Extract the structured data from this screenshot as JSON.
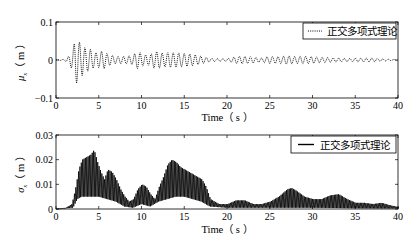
{
  "chart_data": [
    {
      "type": "line",
      "title": "",
      "xlabel": "Time（s）",
      "ylabel": "μx（m）",
      "xlim": [
        0,
        40
      ],
      "ylim": [
        -0.1,
        0.1
      ],
      "xticks": [
        "0",
        "5",
        "10",
        "15",
        "20",
        "25",
        "30",
        "35",
        "40"
      ],
      "yticks": [
        "-0.1",
        "0",
        "0.1"
      ],
      "grid": false,
      "legend": {
        "position": "upper right",
        "entries": [
          {
            "label": "正交多项式理论",
            "style": "dotted"
          }
        ]
      },
      "series": [
        {
          "name": "正交多项式理论",
          "style": "dotted",
          "envelope_t": [
            0,
            1,
            1.5,
            2,
            2.3,
            2.6,
            3,
            3.5,
            4,
            4.5,
            5,
            5.5,
            6,
            6.5,
            7,
            8,
            9,
            9.5,
            10,
            10.5,
            11,
            11.5,
            12,
            12.5,
            13,
            13.5,
            14,
            15,
            16,
            17,
            18,
            19,
            20,
            21,
            22,
            23,
            24,
            25,
            26,
            27,
            28,
            29,
            30,
            31,
            32,
            33,
            34,
            35,
            36,
            37,
            38,
            39,
            40
          ],
          "envelope_amp": [
            0.001,
            0.002,
            0.01,
            0.03,
            0.07,
            0.055,
            0.05,
            0.04,
            0.045,
            0.035,
            0.04,
            0.05,
            0.03,
            0.02,
            0.012,
            0.01,
            0.012,
            0.025,
            0.02,
            0.018,
            0.022,
            0.04,
            0.045,
            0.035,
            0.035,
            0.03,
            0.025,
            0.018,
            0.015,
            0.012,
            0.008,
            0.007,
            0.006,
            0.012,
            0.01,
            0.008,
            0.006,
            0.015,
            0.018,
            0.02,
            0.012,
            0.01,
            0.009,
            0.008,
            0.01,
            0.01,
            0.007,
            0.006,
            0.005,
            0.005,
            0.004,
            0.003,
            0.003
          ]
        }
      ]
    },
    {
      "type": "line",
      "title": "",
      "xlabel": "Time（s）",
      "ylabel": "σx（m）",
      "xlim": [
        0,
        40
      ],
      "ylim": [
        0,
        0.03
      ],
      "xticks": [
        "0",
        "5",
        "10",
        "15",
        "20",
        "25",
        "30",
        "35",
        "40"
      ],
      "yticks": [
        "0",
        "0.01",
        "0.02",
        "0.03"
      ],
      "grid": false,
      "legend": {
        "position": "upper right",
        "entries": [
          {
            "label": "正交多项式理论",
            "style": "solid"
          }
        ]
      },
      "series": [
        {
          "name": "正交多项式理论",
          "style": "solid",
          "upper_t": [
            0,
            1,
            1.8,
            2.2,
            2.6,
            3,
            3.5,
            4,
            4.4,
            4.8,
            5.2,
            5.6,
            6,
            6.5,
            7,
            7.5,
            8,
            8.5,
            9,
            9.5,
            10,
            10.5,
            11,
            11.5,
            12,
            12.5,
            13,
            13.5,
            14,
            14.5,
            15,
            16,
            17,
            17.5,
            18,
            19,
            20,
            21,
            22,
            23,
            24,
            25,
            26,
            26.5,
            27,
            27.5,
            28,
            29,
            30,
            31,
            32,
            33,
            34,
            35,
            36,
            37,
            38,
            39,
            40
          ],
          "upper_v": [
            0,
            0.0003,
            0.002,
            0.008,
            0.016,
            0.02,
            0.021,
            0.022,
            0.024,
            0.019,
            0.015,
            0.012,
            0.016,
            0.015,
            0.012,
            0.008,
            0.005,
            0.003,
            0.004,
            0.008,
            0.01,
            0.009,
            0.006,
            0.004,
            0.009,
            0.013,
            0.018,
            0.02,
            0.019,
            0.017,
            0.016,
            0.014,
            0.012,
            0.009,
            0.004,
            0.002,
            0.002,
            0.0035,
            0.0035,
            0.002,
            0.002,
            0.003,
            0.005,
            0.0065,
            0.008,
            0.0085,
            0.0075,
            0.005,
            0.004,
            0.004,
            0.0055,
            0.006,
            0.004,
            0.0025,
            0.0025,
            0.002,
            0.0025,
            0.0015,
            0.0008
          ],
          "lower_t": [
            0,
            2,
            2.5,
            3,
            4,
            5,
            6,
            7,
            8,
            9,
            10,
            11,
            12,
            13,
            14,
            15,
            16,
            17,
            18,
            20,
            25,
            30,
            35,
            40
          ],
          "lower_v": [
            0,
            0.0005,
            0.004,
            0.005,
            0.005,
            0.005,
            0.004,
            0.003,
            0.001,
            0.0005,
            0.002,
            0.001,
            0.003,
            0.004,
            0.005,
            0.005,
            0.004,
            0.003,
            0.001,
            0.0005,
            0.0005,
            0.0005,
            0.0003,
            0.0002
          ]
        }
      ]
    }
  ],
  "top": {
    "yticks": [
      "0.1",
      "0",
      "-0.1"
    ],
    "xticks": [
      "0",
      "5",
      "10",
      "15",
      "20",
      "25",
      "30",
      "35",
      "40"
    ],
    "ylabel_main": "μ",
    "ylabel_sub": "x",
    "ylabel_unit": "（ m ）",
    "xlabel": "Time（ s ）",
    "legend_label": "正交多项式理论"
  },
  "bottom": {
    "yticks": [
      "0.03",
      "0.02",
      "0.01",
      "0"
    ],
    "xticks": [
      "0",
      "5",
      "10",
      "15",
      "20",
      "25",
      "30",
      "35",
      "40"
    ],
    "ylabel_main": "σ",
    "ylabel_sub": "x",
    "ylabel_unit": "（ m ）",
    "xlabel": "Time（ s ）",
    "legend_label": "正交多项式理论"
  }
}
